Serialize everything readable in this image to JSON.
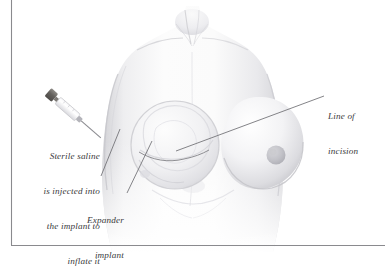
{
  "figure": {
    "name": "breast-tissue-expander-illustration",
    "style": "pencil-shaded medical illustration",
    "background_color": "#ffffff",
    "skin_tone_light": "#fbfbfb",
    "skin_tone_mid": "#e6e6e8",
    "skin_tone_shadow": "#cfcfd3",
    "line_color": "#6e6e72",
    "text_color": "#3a3a3c"
  },
  "frame": {
    "name": "corner-rule",
    "color": "#8a8a8e",
    "vertical_x": 11,
    "horizontal_y": 245
  },
  "labels": {
    "saline": {
      "name": "sterile-saline-label",
      "lines": [
        "Sterile saline",
        "is injected into",
        "the implant to",
        "inflate it"
      ],
      "align": "right"
    },
    "expander": {
      "name": "expander-implant-label",
      "lines": [
        "Expander",
        "implant"
      ],
      "align": "right"
    },
    "incision": {
      "name": "line-of-incision-label",
      "lines": [
        "Line of",
        "incision"
      ],
      "align": "left"
    }
  },
  "leaders": [
    {
      "name": "saline-leader",
      "from": [
        101,
        176
      ],
      "to": [
        120,
        129
      ]
    },
    {
      "name": "expander-leader",
      "from": [
        127,
        193
      ],
      "to": [
        152,
        141
      ]
    },
    {
      "name": "incision-leader",
      "from": [
        176,
        151
      ],
      "to": [
        324,
        96
      ]
    }
  ],
  "anatomy": {
    "implant": {
      "name": "expander-implant",
      "cx": 175,
      "cy": 145,
      "r": 44
    },
    "right_breast": {
      "name": "right-breast",
      "cx": 272,
      "cy": 148,
      "rx": 47,
      "ry": 47
    },
    "nipple": {
      "name": "nipple-areola",
      "cx": 276,
      "cy": 155,
      "r": 9
    }
  },
  "syringe": {
    "name": "syringe",
    "plunger_color": "#6d6a66",
    "barrel_color": "#e9e9ec",
    "needle_color": "#8d8d92",
    "angle_deg": 41
  }
}
